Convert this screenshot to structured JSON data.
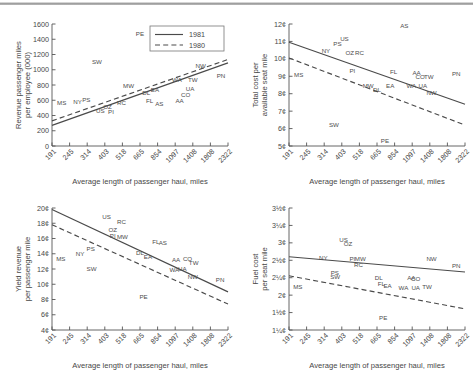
{
  "figure": {
    "panel_count": 4,
    "shared_xlabel": "Average length of passenger haul, miles",
    "shared_xticks": [
      "191",
      "245",
      "314",
      "403",
      "518",
      "665",
      "854",
      "1097",
      "1408",
      "1808",
      "2322"
    ],
    "legend": {
      "present_in_panel": "revenue-passenger-miles",
      "entries": [
        {
          "label": "1981",
          "style": "solid"
        },
        {
          "label": "1980",
          "style": "dashed"
        }
      ]
    }
  },
  "chart_data": [
    {
      "id": "revenue-passenger-miles",
      "type": "scatter",
      "title": "",
      "xlabel": "Average length of passenger haul, miles",
      "ylabel": "Revenue passenger miles\nper employee (000)",
      "ylabel_line1": "Revenue passenger miles",
      "ylabel_line2": "per employee (000)",
      "xticklabels": [
        "191",
        "245",
        "314",
        "403",
        "518",
        "665",
        "854",
        "1097",
        "1408",
        "1808",
        "2322"
      ],
      "yticklabels": [
        "0",
        "200",
        "400",
        "600",
        "800",
        "1000",
        "1200",
        "1400",
        "1600"
      ],
      "ylim": [
        0,
        1600
      ],
      "xlim": [
        0,
        10
      ],
      "grid": false,
      "legend_position": "top-right",
      "points": [
        {
          "label": "MS",
          "x": 0.55,
          "y": 540
        },
        {
          "label": "NY",
          "x": 1.45,
          "y": 550
        },
        {
          "label": "PS",
          "x": 1.95,
          "y": 575
        },
        {
          "label": "SW",
          "x": 2.55,
          "y": 1080
        },
        {
          "label": "US",
          "x": 2.75,
          "y": 430
        },
        {
          "label": "OZ",
          "x": 3.15,
          "y": 480
        },
        {
          "label": "PI",
          "x": 3.35,
          "y": 425
        },
        {
          "label": "RC",
          "x": 3.95,
          "y": 535
        },
        {
          "label": "MW",
          "x": 4.35,
          "y": 760
        },
        {
          "label": "PE",
          "x": 5.0,
          "y": 1440
        },
        {
          "label": "DL",
          "x": 5.35,
          "y": 665
        },
        {
          "label": "FL",
          "x": 5.55,
          "y": 560
        },
        {
          "label": "EA",
          "x": 5.85,
          "y": 710
        },
        {
          "label": "AS",
          "x": 6.1,
          "y": 530
        },
        {
          "label": "WA",
          "x": 7.1,
          "y": 845
        },
        {
          "label": "AA",
          "x": 7.25,
          "y": 560
        },
        {
          "label": "CO",
          "x": 7.6,
          "y": 640
        },
        {
          "label": "UA",
          "x": 7.85,
          "y": 720
        },
        {
          "label": "TW",
          "x": 8.0,
          "y": 840
        },
        {
          "label": "NW",
          "x": 8.45,
          "y": 1025
        },
        {
          "label": "PN",
          "x": 9.6,
          "y": 890
        }
      ],
      "series": [
        {
          "name": "1981",
          "style": "solid",
          "x": [
            0,
            10
          ],
          "y": [
            270,
            1090
          ]
        },
        {
          "name": "1980",
          "style": "dashed",
          "x": [
            0,
            10
          ],
          "y": [
            330,
            1135
          ]
        }
      ]
    },
    {
      "id": "total-cost-per-available-seat-mile",
      "type": "scatter",
      "title": "",
      "xlabel": "Average length of passenger haul, miles",
      "ylabel_line1": "Total cost per",
      "ylabel_line2": "available seat mile",
      "xticklabels": [
        "191",
        "245",
        "314",
        "403",
        "518",
        "665",
        "854",
        "1097",
        "1408",
        "1808",
        "2322"
      ],
      "yticklabels": [
        "5¢",
        "6¢",
        "7¢",
        "8¢",
        "9¢",
        "10¢",
        "11¢",
        "12¢"
      ],
      "ylim": [
        5,
        12
      ],
      "xlim": [
        0,
        10
      ],
      "grid": false,
      "legend_position": "none",
      "points": [
        {
          "label": "MS",
          "x": 0.55,
          "y": 8.95
        },
        {
          "label": "NY",
          "x": 2.1,
          "y": 10.35
        },
        {
          "label": "PS",
          "x": 2.75,
          "y": 10.75
        },
        {
          "label": "US",
          "x": 3.15,
          "y": 11.0
        },
        {
          "label": "SW",
          "x": 2.55,
          "y": 6.1
        },
        {
          "label": "OZ",
          "x": 3.45,
          "y": 10.2
        },
        {
          "label": "RC",
          "x": 4.0,
          "y": 10.25
        },
        {
          "label": "PI",
          "x": 3.6,
          "y": 9.2
        },
        {
          "label": "MW",
          "x": 4.5,
          "y": 8.35
        },
        {
          "label": "DL",
          "x": 5.0,
          "y": 8.1
        },
        {
          "label": "PE",
          "x": 5.45,
          "y": 5.2
        },
        {
          "label": "FL",
          "x": 5.95,
          "y": 9.15
        },
        {
          "label": "EA",
          "x": 5.75,
          "y": 8.35
        },
        {
          "label": "AS",
          "x": 6.55,
          "y": 11.75
        },
        {
          "label": "WA",
          "x": 6.95,
          "y": 8.3
        },
        {
          "label": "AA",
          "x": 7.25,
          "y": 9.1
        },
        {
          "label": "CO",
          "x": 7.45,
          "y": 8.85
        },
        {
          "label": "UA",
          "x": 7.6,
          "y": 8.3
        },
        {
          "label": "TW",
          "x": 7.95,
          "y": 8.85
        },
        {
          "label": "NW",
          "x": 8.1,
          "y": 7.95
        },
        {
          "label": "PN",
          "x": 9.5,
          "y": 9.0
        }
      ],
      "series": [
        {
          "name": "1981",
          "style": "solid",
          "x": [
            0,
            10
          ],
          "y": [
            10.95,
            7.4
          ]
        },
        {
          "name": "1980",
          "style": "dashed",
          "x": [
            0,
            10
          ],
          "y": [
            10.05,
            6.2
          ]
        }
      ]
    },
    {
      "id": "yield-revenue-per-passenger-mile",
      "type": "scatter",
      "title": "",
      "xlabel": "Average length of passenger haul, miles",
      "ylabel_line1": "Yield revenue",
      "ylabel_line2": "per passenger mile",
      "xticklabels": [
        "191",
        "245",
        "314",
        "403",
        "518",
        "665",
        "854",
        "1097",
        "1408",
        "1808",
        "2322"
      ],
      "yticklabels": [
        "4¢",
        "6¢",
        "8¢",
        "10¢",
        "12¢",
        "14¢",
        "16¢",
        "18¢",
        "20¢"
      ],
      "ylim": [
        4,
        20
      ],
      "xlim": [
        0,
        10
      ],
      "grid": false,
      "legend_position": "none",
      "points": [
        {
          "label": "MS",
          "x": 0.5,
          "y": 13.0
        },
        {
          "label": "NY",
          "x": 1.6,
          "y": 13.7
        },
        {
          "label": "PS",
          "x": 2.2,
          "y": 14.3
        },
        {
          "label": "SW",
          "x": 2.25,
          "y": 11.8
        },
        {
          "label": "US",
          "x": 3.1,
          "y": 18.5
        },
        {
          "label": "OZ",
          "x": 3.45,
          "y": 16.9
        },
        {
          "label": "PI",
          "x": 3.45,
          "y": 16.1
        },
        {
          "label": "RC",
          "x": 3.95,
          "y": 17.9
        },
        {
          "label": "MW",
          "x": 4.0,
          "y": 15.9
        },
        {
          "label": "DL",
          "x": 5.0,
          "y": 13.9
        },
        {
          "label": "PE",
          "x": 5.2,
          "y": 8.1
        },
        {
          "label": "EA",
          "x": 5.45,
          "y": 13.3
        },
        {
          "label": "FL",
          "x": 5.9,
          "y": 15.3
        },
        {
          "label": "AS",
          "x": 6.3,
          "y": 15.1
        },
        {
          "label": "AA",
          "x": 7.05,
          "y": 12.9
        },
        {
          "label": "WA",
          "x": 6.95,
          "y": 11.6
        },
        {
          "label": "UA",
          "x": 7.4,
          "y": 11.7
        },
        {
          "label": "CO",
          "x": 7.7,
          "y": 13.1
        },
        {
          "label": "TW",
          "x": 8.05,
          "y": 12.5
        },
        {
          "label": "NW",
          "x": 8.0,
          "y": 10.7
        },
        {
          "label": "PN",
          "x": 9.55,
          "y": 10.3
        }
      ],
      "series": [
        {
          "name": "1981",
          "style": "solid",
          "x": [
            0,
            10
          ],
          "y": [
            19.8,
            9.0
          ]
        },
        {
          "name": "1980",
          "style": "dashed",
          "x": [
            0,
            10
          ],
          "y": [
            17.8,
            7.4
          ]
        }
      ]
    },
    {
      "id": "fuel-cost-per-seat-mile",
      "type": "scatter",
      "title": "",
      "xlabel": "Average length of passenger haul, miles",
      "ylabel_line1": "Fuel cost",
      "ylabel_line2": "per seat mile",
      "xticklabels": [
        "191",
        "245",
        "314",
        "403",
        "518",
        "665",
        "854",
        "1097",
        "1408",
        "1808",
        "2322"
      ],
      "yticklabels": [
        "1¼¢",
        "1½¢",
        "2¢",
        "2¼¢",
        "2½¢",
        "3¢",
        "3¼¢",
        "3½¢"
      ],
      "ylim": [
        1.25,
        3.5
      ],
      "xlim": [
        0,
        10
      ],
      "grid": false,
      "legend_position": "none",
      "points": [
        {
          "label": "MS",
          "x": 0.5,
          "y": 2.0
        },
        {
          "label": "NY",
          "x": 1.95,
          "y": 2.54
        },
        {
          "label": "PS",
          "x": 2.6,
          "y": 2.27
        },
        {
          "label": "SW",
          "x": 2.62,
          "y": 2.19
        },
        {
          "label": "US",
          "x": 3.1,
          "y": 2.87
        },
        {
          "label": "OZ",
          "x": 3.35,
          "y": 2.79
        },
        {
          "label": "PI",
          "x": 3.6,
          "y": 2.52
        },
        {
          "label": "MW",
          "x": 4.05,
          "y": 2.52
        },
        {
          "label": "RC",
          "x": 3.95,
          "y": 2.42
        },
        {
          "label": "DL",
          "x": 5.1,
          "y": 2.18
        },
        {
          "label": "FL",
          "x": 5.25,
          "y": 2.06
        },
        {
          "label": "PE",
          "x": 5.35,
          "y": 1.43
        },
        {
          "label": "EA",
          "x": 5.6,
          "y": 2.03
        },
        {
          "label": "WA",
          "x": 6.5,
          "y": 1.98
        },
        {
          "label": "AA",
          "x": 6.95,
          "y": 2.18
        },
        {
          "label": "CO",
          "x": 7.2,
          "y": 2.16
        },
        {
          "label": "UA",
          "x": 7.2,
          "y": 1.98
        },
        {
          "label": "TW",
          "x": 7.85,
          "y": 2.0
        },
        {
          "label": "NW",
          "x": 8.1,
          "y": 2.53
        },
        {
          "label": "PN",
          "x": 9.5,
          "y": 2.4
        }
      ],
      "series": [
        {
          "name": "1981",
          "style": "solid",
          "x": [
            0,
            10
          ],
          "y": [
            2.6,
            2.32
          ]
        },
        {
          "name": "1980",
          "style": "dashed",
          "x": [
            0,
            10
          ],
          "y": [
            2.25,
            1.64
          ]
        }
      ]
    }
  ]
}
